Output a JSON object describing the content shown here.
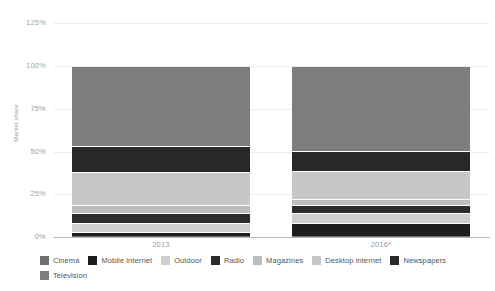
{
  "chart_data": {
    "type": "bar",
    "stacked": true,
    "title": "",
    "xlabel": "",
    "ylabel": "Market share",
    "categories": [
      "2013",
      "2016*"
    ],
    "ylim": [
      0,
      125
    ],
    "yticks": [
      "0%",
      "25%",
      "50%",
      "75%",
      "100%",
      "125%"
    ],
    "ytick_values": [
      0,
      25,
      50,
      75,
      100,
      125
    ],
    "grid": true,
    "legend_position": "bottom",
    "series": [
      {
        "name": "Cinema",
        "color": "#6f6f6f",
        "values": [
          0.6,
          0.6
        ]
      },
      {
        "name": "Mobile internet",
        "color": "#1d1d1d",
        "values": [
          2.4,
          7.8
        ]
      },
      {
        "name": "Outdoor",
        "color": "#cfcfcf",
        "values": [
          5.4,
          5.4
        ]
      },
      {
        "name": "Radio",
        "color": "#2b2b2b",
        "values": [
          5.4,
          5.0
        ]
      },
      {
        "name": "Magazines",
        "color": "#bdbdbd",
        "values": [
          5.1,
          3.6
        ]
      },
      {
        "name": "Desktop internet",
        "color": "#c7c7c7",
        "values": [
          19.1,
          16.0
        ]
      },
      {
        "name": "Newspapers",
        "color": "#282828",
        "values": [
          15.0,
          12.0
        ]
      },
      {
        "name": "Television",
        "color": "#7d7d7d",
        "values": [
          47.0,
          49.6
        ]
      }
    ]
  },
  "axis": {
    "y_title": "Market share",
    "y_ticks": [
      {
        "label": "125%",
        "value": 125
      },
      {
        "label": "100%",
        "value": 100
      },
      {
        "label": "75%",
        "value": 75
      },
      {
        "label": "50%",
        "value": 50
      },
      {
        "label": "25%",
        "value": 25
      },
      {
        "label": "0%",
        "value": 0
      }
    ],
    "x_ticks": [
      "2013",
      "2016*"
    ]
  },
  "legend": {
    "items": [
      {
        "label": "Cinema",
        "color": "#6f6f6f"
      },
      {
        "label": "Mobile internet",
        "color": "#1d1d1d"
      },
      {
        "label": "Outdoor",
        "color": "#cfcfcf"
      },
      {
        "label": "Radio",
        "color": "#2b2b2b"
      },
      {
        "label": "Magazines",
        "color": "#bdbdbd"
      },
      {
        "label": "Desktop internet",
        "color": "#c7c7c7"
      },
      {
        "label": "Newspapers",
        "color": "#282828"
      },
      {
        "label": "Television",
        "color": "#7d7d7d"
      }
    ]
  },
  "colors": {
    "grid": "#eceff1",
    "axis": "#b9b9b9",
    "tick_text": "#a2a2a2",
    "legend_text": "#555555",
    "background": "#ffffff"
  }
}
